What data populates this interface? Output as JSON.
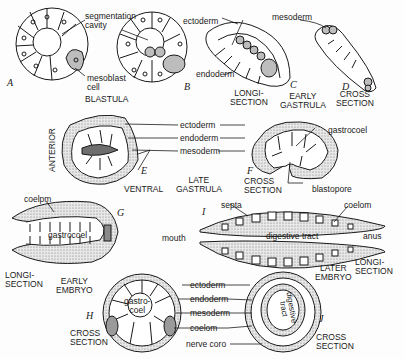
{
  "figure": {
    "panels": [
      {
        "id": "A",
        "letter": "A"
      },
      {
        "id": "B",
        "letter": "B"
      },
      {
        "id": "C",
        "letter": "C"
      },
      {
        "id": "D",
        "letter": "D"
      },
      {
        "id": "E",
        "letter": "E"
      },
      {
        "id": "F",
        "letter": "F"
      },
      {
        "id": "G",
        "letter": "G"
      },
      {
        "id": "H",
        "letter": "H"
      },
      {
        "id": "I",
        "letter": "I"
      },
      {
        "id": "J",
        "letter": "J"
      }
    ],
    "stage_captions": {
      "blastula": "BLASTULA",
      "early_gastrula": "EARLY\nGASTRULA",
      "late_gastrula": "LATE\nGASTRULA",
      "early_embryo": "EARLY\nEMBRYO",
      "later_embryo": "LATER\nEMBRYO"
    },
    "section_captions": {
      "c_longi": "LONGI-\nSECTION",
      "d_cross": "CROSS\nSECTION",
      "f_cross": "CROSS\nSECTION",
      "g_longi": "LONGI-\nSECTION",
      "h_cross": "CROSS\nSECTION",
      "i_longi": "LONGI-\nSECTION",
      "j_cross": "CROSS\nSECTION"
    },
    "orientation": {
      "anterior": "ANTERIOR",
      "ventral": "VENTRAL"
    },
    "labels": {
      "segmentation_cavity": "segmentation\ncavity",
      "mesoblast_cell": "mesoblast\ncell",
      "ectoderm_c": "ectoderm",
      "mesoderm_c": "mesoderm",
      "endoderm_c": "endoderm",
      "ectoderm_e": "ectoderm",
      "endoderm_e": "endoderm",
      "mesoderm_e": "mesoderm",
      "gastrocoel_f": "gastrocoel",
      "blastopore": "blastopore",
      "coelom_g": "coelpm",
      "gastrocoel_g": "gastrocoel",
      "septa": "septa",
      "coelom_i": "coelom",
      "mouth": "mouth",
      "digestive_tract_i": "digestive tract",
      "anus": "anus",
      "gastrocoel_h": "gastro-\ncoel",
      "ectoderm_hj": "ectoderm",
      "endoderm_hj": "endoderm",
      "mesoderm_hj": "mesoderm",
      "coelom_hj": "coelom",
      "nerve_cord": "nerve coro",
      "digestive_tract_j": "digestive\ntract"
    },
    "colors": {
      "ink": "#1a1a1a",
      "mesoderm_fill": "#bdbdbd",
      "stipple": "#9a9a9a",
      "paper": "#fdfdfd"
    }
  }
}
